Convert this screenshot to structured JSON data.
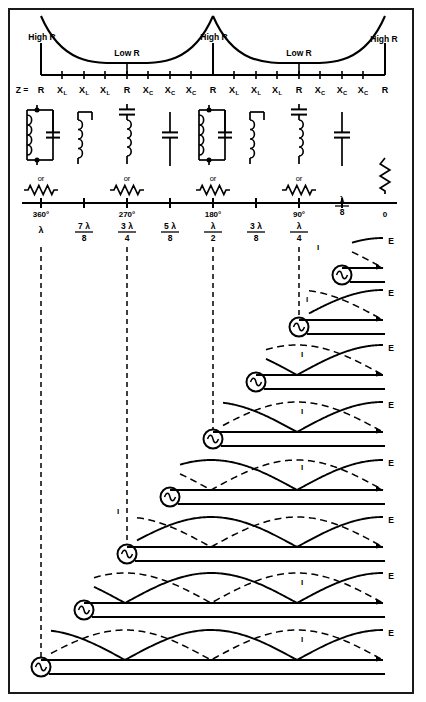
{
  "figure": {
    "title_hidden": "",
    "impedance_curve": {
      "high_r_labels": [
        "High R",
        "High R",
        "High R"
      ],
      "low_r_labels": [
        "Low R",
        "Low R"
      ],
      "high_r_x": [
        41,
        213,
        385
      ],
      "low_r_x": [
        127,
        299
      ],
      "axis_y": 75,
      "minor_tick_x": [
        62,
        84,
        105,
        127,
        148,
        170,
        191,
        234,
        256,
        277,
        299,
        320,
        342,
        363
      ]
    },
    "z_row": {
      "prefix": "Z =",
      "prefix_x": 22,
      "values": [
        {
          "main": "R",
          "sub": "",
          "x": 41
        },
        {
          "main": "X",
          "sub": "L",
          "x": 62
        },
        {
          "main": "X",
          "sub": "L",
          "x": 84
        },
        {
          "main": "X",
          "sub": "L",
          "x": 105
        },
        {
          "main": "R",
          "sub": "",
          "x": 127
        },
        {
          "main": "X",
          "sub": "C",
          "x": 148
        },
        {
          "main": "X",
          "sub": "C",
          "x": 170
        },
        {
          "main": "X",
          "sub": "C",
          "x": 191
        },
        {
          "main": "R",
          "sub": "",
          "x": 213
        },
        {
          "main": "X",
          "sub": "L",
          "x": 234
        },
        {
          "main": "X",
          "sub": "L",
          "x": 256
        },
        {
          "main": "X",
          "sub": "L",
          "x": 277
        },
        {
          "main": "R",
          "sub": "",
          "x": 299
        },
        {
          "main": "X",
          "sub": "C",
          "x": 320
        },
        {
          "main": "X",
          "sub": "C",
          "x": 342
        },
        {
          "main": "X",
          "sub": "C",
          "x": 363
        },
        {
          "main": "R",
          "sub": "",
          "x": 385
        }
      ],
      "y": 93
    },
    "equivalent_circuits": {
      "or_label": "or",
      "items": [
        {
          "kind": "parallel-lc",
          "x": 41,
          "or": true
        },
        {
          "kind": "inductor",
          "x": 84,
          "or": false
        },
        {
          "kind": "series-lc",
          "x": 127,
          "or": true
        },
        {
          "kind": "capacitor",
          "x": 170,
          "or": false
        },
        {
          "kind": "parallel-lc",
          "x": 213,
          "or": true
        },
        {
          "kind": "inductor",
          "x": 256,
          "or": false
        },
        {
          "kind": "series-lc",
          "x": 299,
          "or": true
        },
        {
          "kind": "capacitor",
          "x": 342,
          "or": false
        },
        {
          "kind": "resistor-v",
          "x": 385,
          "or": false
        }
      ]
    },
    "degree_axis": {
      "y": 203,
      "ticks": [
        {
          "label": "360°",
          "x": 41,
          "major": true
        },
        {
          "label": "",
          "x": 84,
          "major": true
        },
        {
          "label": "270°",
          "x": 127,
          "major": true
        },
        {
          "label": "",
          "x": 170,
          "major": true
        },
        {
          "label": "180°",
          "x": 213,
          "major": true
        },
        {
          "label": "",
          "x": 256,
          "major": true
        },
        {
          "label": "90°",
          "x": 299,
          "major": true
        },
        {
          "label": "",
          "x": 342,
          "major": true
        },
        {
          "label": "0",
          "x": 385,
          "major": false
        }
      ],
      "zero_label": "0",
      "zero_x": 385
    },
    "wavelength_row": {
      "y_num": 230,
      "items": [
        {
          "num": "λ",
          "den": "",
          "x": 41,
          "whole": true
        },
        {
          "num": "7 λ",
          "den": "8",
          "x": 84,
          "whole": false
        },
        {
          "num": "3 λ",
          "den": "4",
          "x": 127,
          "whole": false
        },
        {
          "num": "5 λ",
          "den": "8",
          "x": 170,
          "whole": false
        },
        {
          "num": "λ",
          "den": "2",
          "x": 213,
          "whole": false
        },
        {
          "num": "3 λ",
          "den": "8",
          "x": 256,
          "whole": false
        },
        {
          "num": "λ",
          "den": "4",
          "x": 299,
          "whole": false
        },
        {
          "num": "λ",
          "den": "8",
          "x": 342,
          "whole": false,
          "above_axis": true
        }
      ]
    },
    "standing_waves": {
      "e_label": "E",
      "i_label": "I",
      "e_label_x": 391,
      "line_end_x": 383,
      "rows": [
        {
          "gen_x": 342,
          "baseline_y": 268,
          "len_lambda": "1/8",
          "i_label_x": 318,
          "i_label_y": 250
        },
        {
          "gen_x": 299,
          "baseline_y": 320,
          "len_lambda": "1/4",
          "i_label_x": 307,
          "i_label_y": 302
        },
        {
          "gen_x": 256,
          "baseline_y": 375,
          "len_lambda": "3/8",
          "i_label_x": 302,
          "i_label_y": 357
        },
        {
          "gen_x": 213,
          "baseline_y": 432,
          "len_lambda": "1/2",
          "i_label_x": 302,
          "i_label_y": 414
        },
        {
          "gen_x": 170,
          "baseline_y": 490,
          "len_lambda": "5/8",
          "i_label_x": 302,
          "i_label_y": 470
        },
        {
          "gen_x": 127,
          "baseline_y": 547,
          "len_lambda": "3/4",
          "i_label_x": 118,
          "i_label_y": 514
        },
        {
          "gen_x": 84,
          "baseline_y": 603,
          "len_lambda": "7/8",
          "i_label_x": 302,
          "i_label_y": 585
        },
        {
          "gen_x": 41,
          "baseline_y": 660,
          "len_lambda": "1",
          "i_label_x": 302,
          "i_label_y": 642
        }
      ]
    },
    "dashed_verticals_x": [
      41,
      127,
      213,
      299
    ],
    "colors": {
      "ink": "#000000",
      "paper": "#ffffff",
      "frame": "#1a1a1a"
    }
  }
}
